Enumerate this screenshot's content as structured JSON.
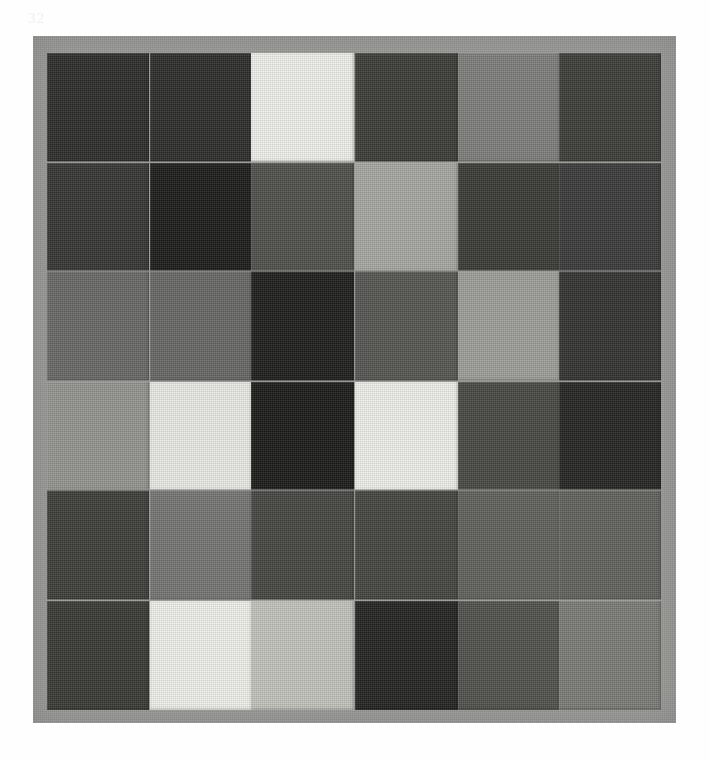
{
  "page": {
    "background_color": "#fefefe",
    "margin_mark": "32"
  },
  "artwork": {
    "title": "Grid of gray fabric squares",
    "board_color": "#9b9b99",
    "rows": 6,
    "columns": 6
  },
  "chart_data": {
    "type": "heatmap",
    "xlabel": "",
    "ylabel": "",
    "categories": [
      "C1",
      "C2",
      "C3",
      "C4",
      "C5",
      "C6"
    ],
    "row_labels": [
      "R1",
      "R2",
      "R3",
      "R4",
      "R5",
      "R6"
    ],
    "legend": [],
    "grid": false,
    "value_scale": "0 = black, 100 = white (relative luminance)",
    "values": [
      [
        17,
        17,
        94,
        22,
        49,
        23
      ],
      [
        20,
        10,
        30,
        65,
        22,
        22
      ],
      [
        40,
        40,
        11,
        33,
        62,
        19
      ],
      [
        58,
        92,
        10,
        93,
        28,
        13
      ],
      [
        24,
        46,
        27,
        26,
        37,
        37
      ],
      [
        22,
        94,
        76,
        13,
        31,
        48
      ]
    ],
    "colors": [
      [
        "#2c2c2a",
        "#2c2c2a",
        "#f0f0ec",
        "#3a3a37",
        "#7d7d7b",
        "#3b3b38"
      ],
      [
        "#343432",
        "#1b1b19",
        "#4e4e4b",
        "#a6a6a2",
        "#393936",
        "#39393a"
      ],
      [
        "#686866",
        "#676765",
        "#1d1d1b",
        "#555552",
        "#9e9e9a",
        "#323230"
      ],
      [
        "#949490",
        "#ebebe7",
        "#1a1a18",
        "#efefeb",
        "#474744",
        "#232321"
      ],
      [
        "#3c3c39",
        "#757573",
        "#454542",
        "#434340",
        "#5f5f5c",
        "#60605d"
      ],
      [
        "#383835",
        "#f0f0ec",
        "#c3c3bd",
        "#222220",
        "#4f4f4c",
        "#7a7a77"
      ]
    ]
  }
}
